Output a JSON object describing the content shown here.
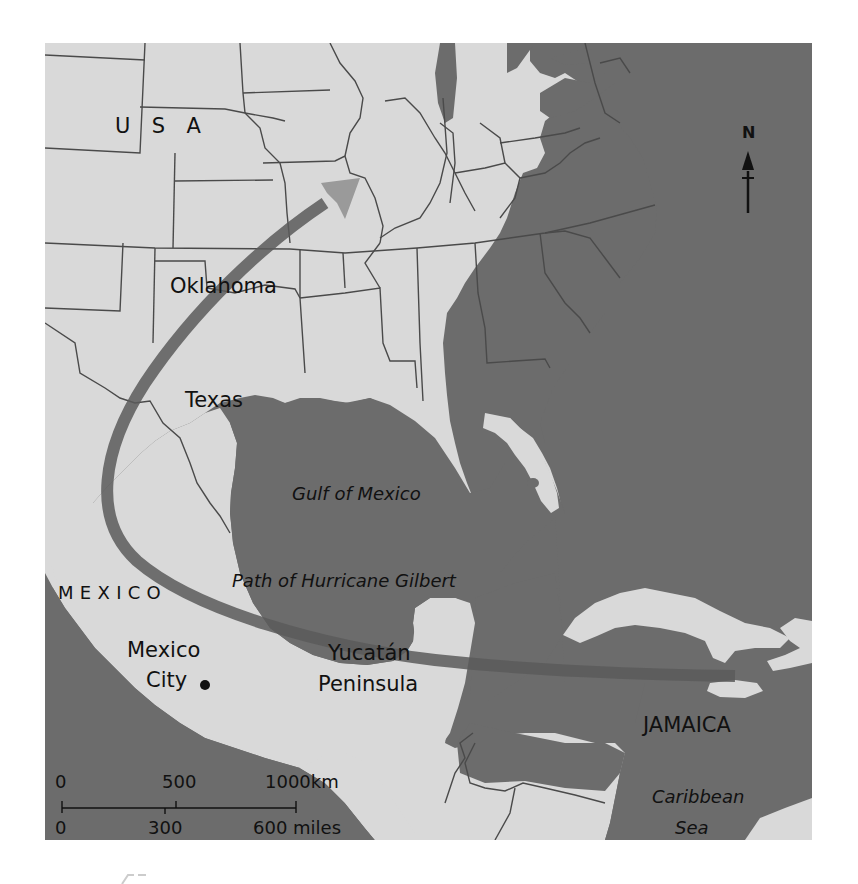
{
  "map": {
    "title_hint": "Path of Hurricane Gilbert",
    "colors": {
      "water": "#6c6c6c",
      "land": "#d9d9d9",
      "border": "#4a4a4a",
      "path": "#5a5a5a",
      "background": "#ffffff"
    },
    "labels": {
      "usa": "U  S  A",
      "oklahoma": "Oklahoma",
      "texas": "Texas",
      "gulf": "Gulf of Mexico",
      "path": "Path of Hurricane Gilbert",
      "mexico": "MEXICO",
      "mexico_city_line1": "Mexico",
      "mexico_city_line2": "City",
      "yucatan_line1": "Yucatán",
      "yucatan_line2": "Peninsula",
      "jamaica": "JAMAICA",
      "caribbean_line1": "Caribbean",
      "caribbean_line2": "Sea"
    },
    "compass": {
      "label": "N"
    },
    "scale_bar": {
      "km_ticks": [
        "0",
        "500",
        "1000km"
      ],
      "mile_ticks": [
        "0",
        "300",
        "600 miles"
      ]
    }
  }
}
